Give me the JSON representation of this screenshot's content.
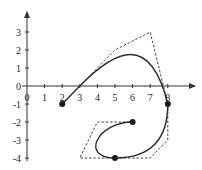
{
  "chart_data": {
    "type": "line",
    "title": "",
    "xlabel": "",
    "ylabel": "",
    "xlim": [
      0,
      9.5
    ],
    "ylim": [
      -4.2,
      4.2
    ],
    "x_ticks": [
      "0",
      "1",
      "2",
      "3",
      "4",
      "5",
      "6",
      "7",
      "8"
    ],
    "y_ticks": [
      "3",
      "2",
      "1",
      "0",
      "-1",
      "-2",
      "-3",
      "-4"
    ],
    "grid": false,
    "legend": null,
    "marked_points": [
      {
        "x": 2,
        "y": -1
      },
      {
        "x": 8,
        "y": -1
      },
      {
        "x": 5,
        "y": -4
      },
      {
        "x": 6,
        "y": -2
      }
    ],
    "control_polygon": [
      {
        "x": 3,
        "y": 0
      },
      {
        "x": 5,
        "y": 2
      },
      {
        "x": 7,
        "y": 3
      },
      {
        "x": 8,
        "y": -1
      },
      {
        "x": 8,
        "y": -3
      },
      {
        "x": 7,
        "y": -4
      },
      {
        "x": 5,
        "y": -4
      },
      {
        "x": 3,
        "y": -4
      },
      {
        "x": 4,
        "y": -2
      },
      {
        "x": 6,
        "y": -2
      }
    ],
    "series": [
      {
        "name": "line segment",
        "style": "solid",
        "points": [
          {
            "x": 2,
            "y": -1
          },
          {
            "x": 3,
            "y": 0
          }
        ]
      },
      {
        "name": "bezier 1",
        "style": "solid",
        "points": [
          {
            "x": 3,
            "y": 0
          },
          {
            "x": 5,
            "y": 2
          },
          {
            "x": 7,
            "y": 3
          },
          {
            "x": 8,
            "y": -1
          }
        ]
      },
      {
        "name": "bezier 2",
        "style": "solid",
        "points": [
          {
            "x": 8,
            "y": -1
          },
          {
            "x": 8,
            "y": -3
          },
          {
            "x": 7,
            "y": -4
          },
          {
            "x": 5,
            "y": -4
          }
        ]
      },
      {
        "name": "bezier 3",
        "style": "solid",
        "points": [
          {
            "x": 5,
            "y": -4
          },
          {
            "x": 3,
            "y": -4
          },
          {
            "x": 4,
            "y": -2
          },
          {
            "x": 6,
            "y": -2
          }
        ]
      }
    ]
  },
  "axes": {
    "x_labels": [
      {
        "text": "0",
        "px": 27
      },
      {
        "text": "1",
        "px": 44.6
      },
      {
        "text": "2",
        "px": 62.2
      },
      {
        "text": "3",
        "px": 79.8
      },
      {
        "text": "4",
        "px": 97.4
      },
      {
        "text": "5",
        "px": 115
      },
      {
        "text": "6",
        "px": 132.6
      },
      {
        "text": "7",
        "px": 150.2
      },
      {
        "text": "8",
        "px": 167.8
      }
    ],
    "y_labels": [
      {
        "text": "3",
        "py": 32
      },
      {
        "text": "2",
        "py": 50
      },
      {
        "text": "1",
        "py": 68
      },
      {
        "text": "0",
        "py": 86
      },
      {
        "text": "-1",
        "py": 104
      },
      {
        "text": "-2",
        "py": 122
      },
      {
        "text": "-3",
        "py": 140
      },
      {
        "text": "-4",
        "py": 158
      }
    ]
  },
  "colors": {
    "curve": "#2b2b2b",
    "polygon": "#444444",
    "axis": "#333333",
    "point": "#1a1a1a"
  }
}
